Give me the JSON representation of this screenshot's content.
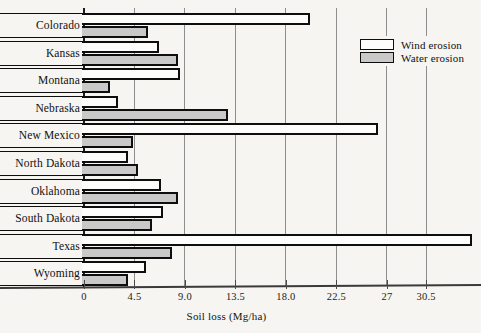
{
  "chart_data": {
    "type": "bar",
    "orientation": "horizontal",
    "title": "",
    "xlabel": "Soil loss (Mg/ha)",
    "ylabel": "",
    "xlim": [
      0,
      34.9
    ],
    "grid": true,
    "gridlines_axis": "x",
    "xticks": [
      0,
      4.5,
      9.0,
      13.5,
      18.0,
      22.5,
      27,
      30.5
    ],
    "xticklabels": [
      "0",
      "4.5",
      "9.0",
      "13.5",
      "18.0",
      "22.5",
      "27",
      "30.5"
    ],
    "legend_position": "top-right",
    "categories": [
      "Colorado",
      "Kansas",
      "Montana",
      "Nebraska",
      "New Mexico",
      "North Dakota",
      "Oklahoma",
      "South Dakota",
      "Texas",
      "Wyoming"
    ],
    "series": [
      {
        "name": "Wind erosion",
        "color": "#fdfdfb",
        "values": [
          20.1,
          6.7,
          8.6,
          3.0,
          26.2,
          3.9,
          6.9,
          7.0,
          34.6,
          5.5
        ]
      },
      {
        "name": "Water erosion",
        "color": "#c9c9c9",
        "values": [
          5.7,
          8.4,
          2.3,
          12.8,
          4.4,
          4.8,
          8.4,
          6.1,
          7.8,
          3.9
        ]
      }
    ]
  },
  "legend": {
    "items": [
      {
        "label": "Wind erosion",
        "swatch": "wind"
      },
      {
        "label": "Water erosion",
        "swatch": "water"
      }
    ]
  },
  "axis": {
    "x_title": "Soil loss (Mg/ha)"
  }
}
